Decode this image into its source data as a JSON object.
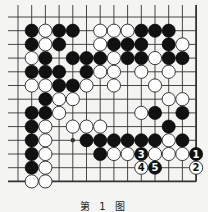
{
  "diagram": {
    "caption": "第 1 图",
    "grid": {
      "columns": 14,
      "rows": 13,
      "origin_x": 18,
      "origin_y": 17,
      "spacing": 13.7,
      "right_edge_col": 13,
      "bottom_edge_row": 12,
      "star_points": [
        [
          4,
          9
        ]
      ]
    },
    "colors": {
      "background": "#f4f4f2",
      "line": "#333333",
      "black_stone": "#111111",
      "white_stone": "#ffffff"
    },
    "stones": {
      "black": [
        [
          1,
          1
        ],
        [
          3,
          1
        ],
        [
          4,
          1
        ],
        [
          9,
          1
        ],
        [
          10,
          1
        ],
        [
          11,
          1
        ],
        [
          1,
          2
        ],
        [
          3,
          2
        ],
        [
          7,
          2
        ],
        [
          8,
          2
        ],
        [
          9,
          2
        ],
        [
          11,
          2
        ],
        [
          2,
          3
        ],
        [
          4,
          3
        ],
        [
          5,
          3
        ],
        [
          6,
          3
        ],
        [
          8,
          3
        ],
        [
          9,
          3
        ],
        [
          11,
          3
        ],
        [
          12,
          3
        ],
        [
          1,
          4
        ],
        [
          2,
          4
        ],
        [
          3,
          4
        ],
        [
          5,
          4
        ],
        [
          3,
          5
        ],
        [
          4,
          5
        ],
        [
          2,
          6
        ],
        [
          1,
          7
        ],
        [
          2,
          7
        ],
        [
          10,
          7
        ],
        [
          12,
          7
        ],
        [
          1,
          8
        ],
        [
          11,
          8
        ],
        [
          1,
          9
        ],
        [
          5,
          9
        ],
        [
          6,
          9
        ],
        [
          7,
          9
        ],
        [
          8,
          9
        ],
        [
          9,
          9
        ],
        [
          10,
          9
        ],
        [
          12,
          9
        ],
        [
          1,
          10
        ],
        [
          6,
          10
        ],
        [
          1,
          11
        ]
      ],
      "white": [
        [
          2,
          1
        ],
        [
          6,
          1
        ],
        [
          7,
          1
        ],
        [
          8,
          1
        ],
        [
          2,
          2
        ],
        [
          6,
          2
        ],
        [
          12,
          2
        ],
        [
          1,
          3
        ],
        [
          7,
          3
        ],
        [
          10,
          3
        ],
        [
          6,
          4
        ],
        [
          7,
          4
        ],
        [
          9,
          4
        ],
        [
          11,
          4
        ],
        [
          1,
          5
        ],
        [
          2,
          5
        ],
        [
          5,
          5
        ],
        [
          7,
          5
        ],
        [
          10,
          5
        ],
        [
          3,
          6
        ],
        [
          4,
          6
        ],
        [
          11,
          6
        ],
        [
          12,
          6
        ],
        [
          3,
          7
        ],
        [
          9,
          7
        ],
        [
          2,
          8
        ],
        [
          4,
          8
        ],
        [
          5,
          8
        ],
        [
          6,
          8
        ],
        [
          2,
          9
        ],
        [
          11,
          9
        ],
        [
          2,
          10
        ],
        [
          7,
          10
        ],
        [
          8,
          10
        ],
        [
          10,
          10
        ],
        [
          11,
          10
        ],
        [
          12,
          10
        ],
        [
          2,
          11
        ],
        [
          1,
          12
        ],
        [
          2,
          12
        ]
      ]
    },
    "moves": [
      {
        "number": "1",
        "color": "black",
        "col": 13,
        "row": 10
      },
      {
        "number": "2",
        "color": "white",
        "col": 13,
        "row": 11
      },
      {
        "number": "3",
        "color": "black",
        "col": 9,
        "row": 10
      },
      {
        "number": "4",
        "color": "white",
        "col": 9,
        "row": 11
      },
      {
        "number": "5",
        "color": "black",
        "col": 10,
        "row": 11
      }
    ]
  }
}
